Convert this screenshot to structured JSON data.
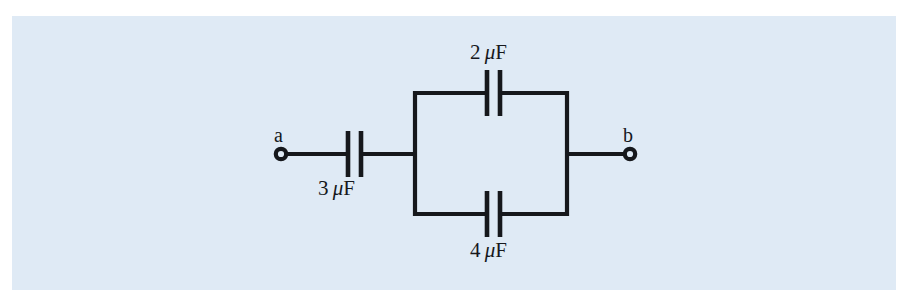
{
  "figure": {
    "kind": "circuit-diagram",
    "background_color": "#dfeaf5",
    "line_color": "#16181c",
    "page_color": "#ffffff"
  },
  "terminals": [
    {
      "id": "a",
      "label": "a",
      "x": 281,
      "y": 154
    },
    {
      "id": "b",
      "label": "b",
      "x": 630,
      "y": 154
    }
  ],
  "capacitors": [
    {
      "id": "c-series",
      "value": "3",
      "unit_mu": "μ",
      "unit_f": "F",
      "label": "3 μF",
      "branch": "series",
      "x": 354,
      "y": 154
    },
    {
      "id": "c-parallel-top",
      "value": "2",
      "unit_mu": "μ",
      "unit_f": "F",
      "label": "2 μF",
      "branch": "parallel-top",
      "x": 492,
      "y": 93
    },
    {
      "id": "c-parallel-bottom",
      "value": "4",
      "unit_mu": "μ",
      "unit_f": "F",
      "label": "4 μF",
      "branch": "parallel-bottom",
      "x": 492,
      "y": 214
    }
  ],
  "geometry": {
    "main_wire_y": 154,
    "top_rail_y": 93,
    "bottom_rail_y": 214,
    "left_rail_x": 415,
    "right_rail_x": 567,
    "panel": {
      "x": 12,
      "y": 16,
      "width": 884,
      "height": 274
    }
  }
}
